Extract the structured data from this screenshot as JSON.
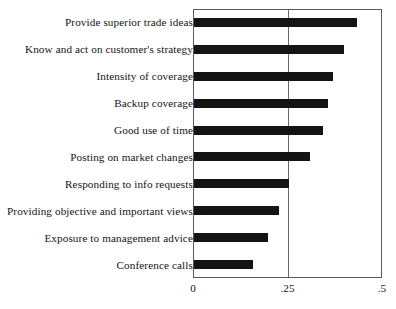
{
  "chart_data": {
    "type": "bar",
    "orientation": "horizontal",
    "title": "",
    "subtitle": "",
    "xlabel": "",
    "ylabel": "",
    "xlim": [
      0,
      0.5
    ],
    "grid": true,
    "gridlines_x": [
      0.25
    ],
    "legend": null,
    "xticks": [
      0,
      0.25,
      0.5
    ],
    "xtick_labels": [
      "0",
      ".25",
      ".5"
    ],
    "categories": [
      "Provide superior trade ideas",
      "Know and act on customer's strategy",
      "Intensity of coverage",
      "Backup coverage",
      "Good use of time",
      "Posting on market changes",
      "Responding to info requests",
      "Providing objective and important views",
      "Exposure to management advice",
      "Conference calls"
    ],
    "values": [
      0.432,
      0.397,
      0.368,
      0.355,
      0.34,
      0.308,
      0.25,
      0.224,
      0.195,
      0.155
    ],
    "bar_color": "#141414",
    "frame_color": "#5a5a5a"
  }
}
